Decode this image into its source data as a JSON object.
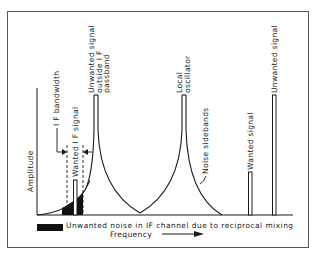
{
  "diagram": {
    "axes": {
      "y_label": "Amplitude",
      "x_label": "Frequency"
    },
    "labels": {
      "if_bandwidth": "I F bandwidth",
      "wanted_if_signal": "Wanted I F signal",
      "unwanted_outside_line1": "Unwanted signal",
      "unwanted_outside_line2": "outside I F",
      "unwanted_outside_line3": "passband",
      "local_osc_line1": "Local",
      "local_osc_line2": "oscillator",
      "noise_sidebands": "Noise sidebands",
      "wanted_signal": "Wanted signal",
      "unwanted_signal": "Unwanted signal"
    },
    "legend": {
      "swatch_color": "#111111",
      "text": "Unwanted noise in IF channel due to reciprocal mixing"
    },
    "colors": {
      "line": "#1a1a1a",
      "border": "#555555",
      "shade": "#111111"
    }
  }
}
